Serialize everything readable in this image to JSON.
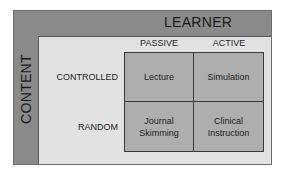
{
  "diagram": {
    "axes": {
      "top_label": "LEARNER",
      "left_label": "CONTENT"
    },
    "columns": [
      "PASSIVE",
      "ACTIVE"
    ],
    "rows": [
      "CONTROLLED",
      "RANDOM"
    ],
    "cells": [
      [
        "Lecture",
        "Simulation"
      ],
      [
        "Journal\nSkimming",
        "Clinical\nInstruction"
      ]
    ],
    "cell_lines": {
      "r0c0": [
        "Lecture"
      ],
      "r0c1": [
        "Simulation"
      ],
      "r1c0": [
        "Journal",
        "Skimming"
      ],
      "r1c1": [
        "Clinical",
        "Instruction"
      ]
    },
    "colors": {
      "band": "#8a8a8a",
      "background": "#e2e2e2",
      "cell_fill": "#aeaeae",
      "border": "#3a3a3a"
    }
  }
}
